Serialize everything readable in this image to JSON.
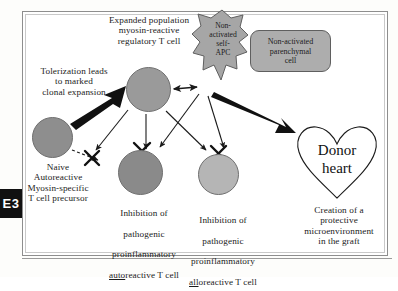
{
  "figure": {
    "edge_tab_label": "E3",
    "colors": {
      "cell_main_fill": "#9a9a9a",
      "cell_naive_fill": "#8e8e8e",
      "cell_autoreactive_fill": "#8a8a8a",
      "cell_alloreactive_fill": "#b5b5b5",
      "apc_fill": "#a6a6a6",
      "parenchymal_fill": "#adadad",
      "stroke": "#1b1b1b",
      "frame": "#8e8e8e"
    }
  },
  "labels": {
    "expanded_population": "Expanded population\nmyosin-reactive\nregulatory T cell",
    "tolerization": "Tolerization leads\nto marked\nclonal expansion",
    "naive_precursor": "Naive\nAutoreactive\nMyosin-specific\nT cell precursor",
    "apc": "Non-\nactivated\nself-\nAPC",
    "parenchymal": "Non-activated\nparenchymal\ncell",
    "donor_heart": "Donor\nheart",
    "inhibition_auto_line1": "Inhibition of",
    "inhibition_auto_line2": "pathogenic",
    "inhibition_auto_line3": "proinflammatory",
    "inhibition_auto_line4_underline": "auto",
    "inhibition_auto_line4_rest": "reactive T cell",
    "inhibition_allo_line1": "Inhibition of",
    "inhibition_allo_line2": "pathogenic",
    "inhibition_allo_line3": "proinflammatory",
    "inhibition_allo_line4_underline": "all",
    "inhibition_allo_line4_rest": "oreactive T cell",
    "graft": "Creation of a\nprotective\nmicroenvironment\nin the graft"
  },
  "shapes": {
    "cell_main_name": "expanded-regulatory-t-cell",
    "cell_naive_name": "naive-autoreactive-t-cell",
    "cell_auto_name": "inhibited-autoreactive-t-cell",
    "cell_allo_name": "inhibited-alloreactive-t-cell",
    "apc_name": "non-activated-self-apc",
    "parenchymal_name": "non-activated-parenchymal-cell",
    "heart_name": "donor-heart"
  }
}
